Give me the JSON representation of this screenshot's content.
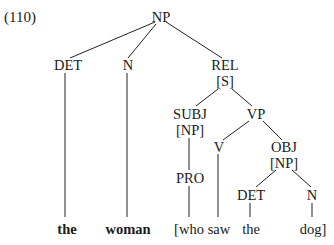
{
  "example_number": "(110)",
  "tree": {
    "nodes": {
      "np_root": "NP",
      "det1": "DET",
      "n1": "N",
      "rel": "REL",
      "rel_s": "[S]",
      "subj": "SUBJ",
      "subj_np": "[NP]",
      "vp": "VP",
      "v": "V",
      "obj": "OBJ",
      "obj_np": "[NP]",
      "pro": "PRO",
      "det2": "DET",
      "n2": "N"
    },
    "words": [
      "the",
      "woman",
      "[who",
      "saw",
      "the",
      "dog]"
    ]
  }
}
